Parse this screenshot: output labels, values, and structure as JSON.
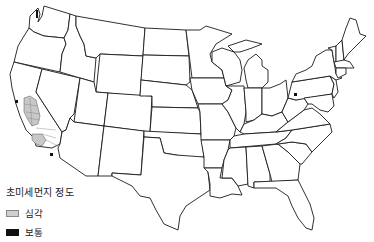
{
  "map": {
    "region": "Contiguous United States",
    "base_fill": "#ffffff",
    "border_color": "#1a1a1a",
    "highlighted_areas": [
      {
        "category": "severe",
        "location": "California Central Valley counties",
        "color": "#c8c8c8"
      },
      {
        "category": "severe",
        "location": "Southern California counties",
        "color": "#c8c8c8"
      },
      {
        "category": "moderate",
        "location": "San Francisco Bay Area",
        "color": "#111111"
      },
      {
        "category": "moderate",
        "location": "Washington Puget Sound",
        "color": "#111111"
      },
      {
        "category": "moderate",
        "location": "Southern California / Imperial",
        "color": "#111111"
      },
      {
        "category": "moderate",
        "location": "Western Pennsylvania",
        "color": "#111111"
      }
    ]
  },
  "legend": {
    "title": "초미세먼지 정도",
    "items": [
      {
        "label": "심각",
        "color": "#cfcfcf"
      },
      {
        "label": "보통",
        "color": "#111111"
      }
    ]
  }
}
